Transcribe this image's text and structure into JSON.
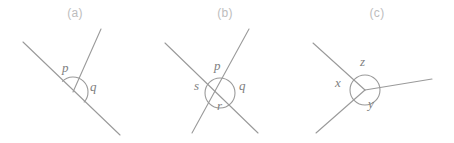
{
  "figure": {
    "width": 454,
    "height": 143,
    "background_color": "#ffffff",
    "line_color": "#9a9a9a",
    "caption_color": "#bdbdbd",
    "label_color": "#808080"
  },
  "panels": [
    {
      "id": "a",
      "caption": "(a)",
      "caption_x": 68,
      "caption_y": 15,
      "vertex": [
        73,
        92
      ],
      "arc_radius": 15,
      "arc_type": "semicircle",
      "labels": [
        {
          "text": "p",
          "x": 62,
          "y": 67
        },
        {
          "text": "q",
          "x": 90,
          "y": 86
        }
      ],
      "segments": [
        {
          "name": "straight-line",
          "x1": 23,
          "y1": 42,
          "x2": 120,
          "y2": 135
        },
        {
          "name": "ray-upper-right",
          "x1": 73,
          "y1": 92,
          "x2": 101,
          "y2": 29
        }
      ]
    },
    {
      "id": "b",
      "caption": "(b)",
      "caption_x": 208,
      "caption_y": 15,
      "vertex": [
        220,
        93
      ],
      "arc_radius": 15,
      "arc_type": "circle",
      "labels": [
        {
          "text": "p",
          "x": 214,
          "y": 65
        },
        {
          "text": "q",
          "x": 239,
          "y": 85
        },
        {
          "text": "r",
          "x": 217,
          "y": 105
        },
        {
          "text": "s",
          "x": 194,
          "y": 85
        }
      ],
      "segments": [
        {
          "name": "line-1",
          "x1": 165,
          "y1": 43,
          "x2": 258,
          "y2": 133
        },
        {
          "name": "line-2",
          "x1": 192,
          "y1": 133,
          "x2": 249,
          "y2": 29
        }
      ]
    },
    {
      "id": "c",
      "caption": "(c)",
      "caption_x": 360,
      "caption_y": 15,
      "vertex": [
        365,
        90
      ],
      "arc_radius": 15,
      "arc_type": "circle",
      "labels": [
        {
          "text": "z",
          "x": 364,
          "y": 62
        },
        {
          "text": "x",
          "x": 339,
          "y": 82
        },
        {
          "text": "y",
          "x": 371,
          "y": 102
        }
      ],
      "segments": [
        {
          "name": "ray-upper-left",
          "x1": 365,
          "y1": 90,
          "x2": 313,
          "y2": 43
        },
        {
          "name": "ray-lower-left",
          "x1": 365,
          "y1": 90,
          "x2": 316,
          "y2": 133
        },
        {
          "name": "ray-right",
          "x1": 365,
          "y1": 90,
          "x2": 432,
          "y2": 79
        }
      ]
    }
  ]
}
